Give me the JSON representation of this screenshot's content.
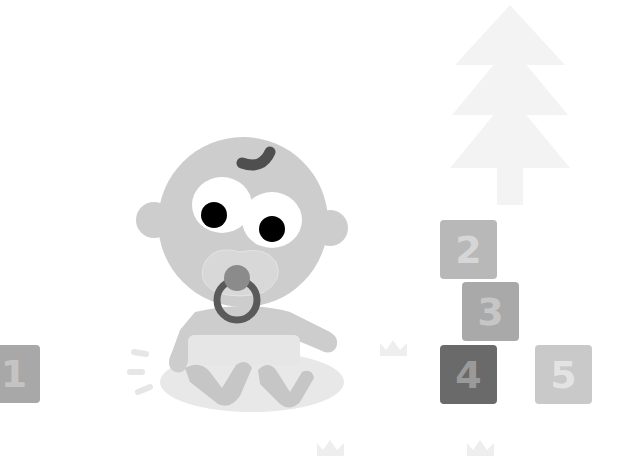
{
  "scene": {
    "description": "Cartoon baby with pacifier sitting near numbered blocks and a tree",
    "background": "#ffffff"
  },
  "blocks": [
    {
      "label": "1",
      "x": -12,
      "y": 345,
      "size": 52,
      "bg": "#a8a8a8",
      "fg": "#c4c4c4"
    },
    {
      "label": "2",
      "x": 440,
      "y": 220,
      "size": 57,
      "bg": "#b8b8b8",
      "fg": "#d6d6d6"
    },
    {
      "label": "3",
      "x": 462,
      "y": 282,
      "size": 57,
      "bg": "#a9a9a9",
      "fg": "#c6c6c6"
    },
    {
      "label": "4",
      "x": 440,
      "y": 345,
      "size": 57,
      "bg": "#6a6a6a",
      "fg": "#9a9a9a"
    },
    {
      "label": "5",
      "x": 535,
      "y": 345,
      "size": 57,
      "bg": "#c9c9c9",
      "fg": "#e3e3e3"
    }
  ],
  "colors": {
    "skin": "#cdcdcd",
    "eye_white": "#ffffff",
    "pupil": "#000000",
    "hair": "#505050",
    "pacifier_ring": "#5a5a5a",
    "pacifier_nub": "#8c8c8c",
    "shield": "#d9d9d9",
    "tree": "#f2f2f2",
    "shadow": "#e9e9e9",
    "crown": "#efefef"
  }
}
